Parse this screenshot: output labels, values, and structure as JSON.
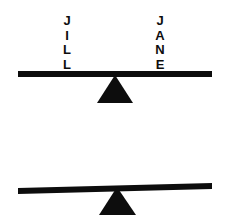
{
  "diagram": {
    "background_color": "#ffffff",
    "ink_color": "#0d0d0d",
    "seesaws": [
      {
        "id": "top",
        "state": "balanced",
        "left_label": "JILL",
        "right_label": "JANE",
        "left_letters": [
          "J",
          "I",
          "L",
          "L"
        ],
        "right_letters": [
          "J",
          "A",
          "N",
          "E"
        ]
      },
      {
        "id": "bottom",
        "state": "tilted-left-down",
        "left_label": "ANNE",
        "right_label": "TOM",
        "left_letters": [
          "A",
          "N",
          "N",
          "E"
        ],
        "right_letters": [
          "T",
          "O",
          "M"
        ]
      }
    ]
  }
}
